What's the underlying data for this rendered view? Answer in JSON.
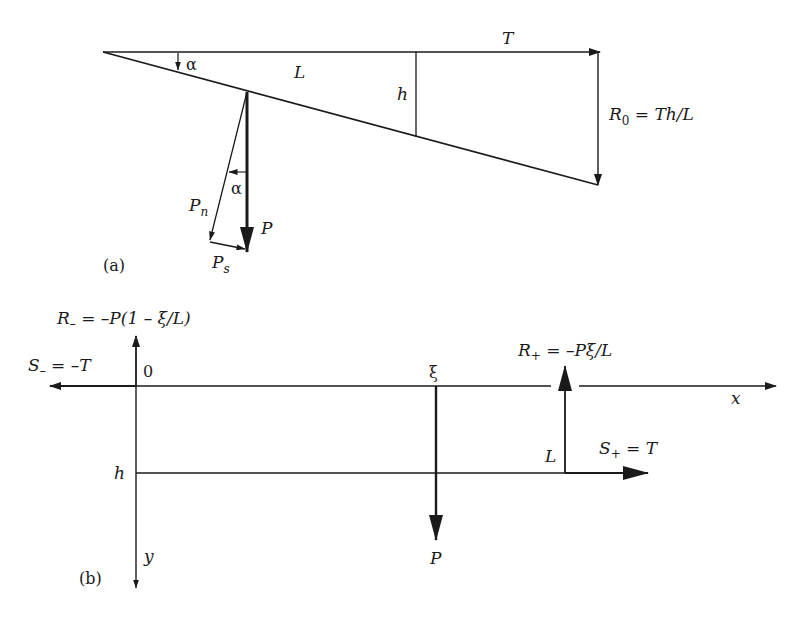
{
  "figure": {
    "panel_a": {
      "caption": "(a)",
      "labels": {
        "alpha_top": "α",
        "length": "L",
        "height": "h",
        "tension": "T",
        "reaction": "R",
        "reaction_sub": "0",
        "reaction_eq": " = Th/L",
        "normal_force": "P",
        "normal_force_sub": "n",
        "alpha_force": "α",
        "load": "P",
        "shear_force": "P",
        "shear_force_sub": "s"
      }
    },
    "panel_b": {
      "caption": "(b)",
      "labels": {
        "r_minus": "R",
        "r_minus_sub": "–",
        "r_minus_eq": " = –P(1 – ξ/L)",
        "s_minus": "S",
        "s_minus_sub": "–",
        "s_minus_eq": " = –T",
        "origin": "0",
        "xi": "ξ",
        "r_plus": "R",
        "r_plus_sub": "+",
        "r_plus_eq": " = –Pξ/L",
        "x_axis": "x",
        "span": "L",
        "s_plus": "S",
        "s_plus_sub": "+",
        "s_plus_eq": " = T",
        "depth": "h",
        "y_axis": "y",
        "load": "P"
      }
    },
    "colors": {
      "ink": "#1a1a1a",
      "background": "#ffffff"
    }
  }
}
